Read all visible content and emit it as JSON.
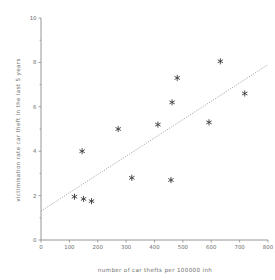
{
  "chart_data": {
    "type": "scatter",
    "title": "",
    "xlabel": "number of car thefts per 100000 inh",
    "ylabel": "victimisation rate car theft in the last 5 years",
    "xlim": [
      0,
      800
    ],
    "ylim": [
      0,
      10
    ],
    "xticks": [
      0,
      100,
      200,
      300,
      400,
      500,
      600,
      700,
      800
    ],
    "yticks": [
      0,
      2,
      4,
      6,
      8,
      10
    ],
    "xtick_labels": [
      "0",
      "100",
      "200",
      "300",
      "400",
      "500",
      "600",
      "700",
      "800"
    ],
    "ytick_labels": [
      "0",
      "2",
      "4",
      "6",
      "8",
      "10"
    ],
    "minor_yticks": [
      1,
      3,
      5,
      7,
      9
    ],
    "grid": false,
    "legend": null,
    "marker_style": "asterisk",
    "marker_color": "#333333",
    "points": [
      {
        "x": 118,
        "y": 1.95
      },
      {
        "x": 145,
        "y": 4.0
      },
      {
        "x": 150,
        "y": 1.85
      },
      {
        "x": 178,
        "y": 1.75
      },
      {
        "x": 272,
        "y": 5.0
      },
      {
        "x": 320,
        "y": 2.8
      },
      {
        "x": 412,
        "y": 5.2
      },
      {
        "x": 458,
        "y": 2.7
      },
      {
        "x": 462,
        "y": 6.2
      },
      {
        "x": 480,
        "y": 7.3
      },
      {
        "x": 592,
        "y": 5.3
      },
      {
        "x": 632,
        "y": 8.05
      },
      {
        "x": 718,
        "y": 6.6
      }
    ],
    "trendline": {
      "type": "linear",
      "style": "dotted",
      "color": "#7a7a7a",
      "x_start": 0,
      "y_start": 1.3,
      "x_end": 800,
      "y_end": 7.9
    }
  }
}
